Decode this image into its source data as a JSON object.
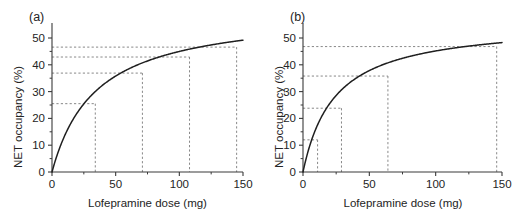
{
  "figure": {
    "background_color": "#ffffff",
    "curve_color": "#1f1f1f",
    "guide_color": "#7a7a7a",
    "axis_color": "#3a3a3a"
  },
  "panels": [
    {
      "id": "a",
      "label": "(a)",
      "axis_x_title": "Lofepramine dose (mg)",
      "axis_y_title": "NET occupancy (%)",
      "x_ticks": [
        "0",
        "50",
        "100",
        "150"
      ],
      "y_ticks": [
        "0",
        "10",
        "20",
        "30",
        "40",
        "50"
      ]
    },
    {
      "id": "b",
      "label": "(b)",
      "axis_x_title": "Lofepramine dose (mg)",
      "axis_y_title": "NET occupancy (%)",
      "x_ticks": [
        "0",
        "50",
        "100",
        "150"
      ],
      "y_ticks": [
        "0",
        "10",
        "20",
        "30",
        "40",
        "50"
      ]
    }
  ],
  "chart_data": [
    {
      "type": "line",
      "panel": "a",
      "title": "(a)",
      "xlabel": "Lofepramine dose (mg)",
      "ylabel": "NET occupancy (%)",
      "xlim": [
        0,
        150
      ],
      "ylim": [
        0,
        50
      ],
      "xticks": [
        0,
        50,
        100,
        150
      ],
      "yticks": [
        0,
        10,
        20,
        30,
        40,
        50
      ],
      "grid": false,
      "legend": "none",
      "model": "Emax saturating dose-occupancy curve",
      "emax": 60.5,
      "ed50": 34.5,
      "x": [
        0,
        5,
        10,
        15,
        20,
        25,
        30,
        34,
        40,
        50,
        60,
        70,
        80,
        90,
        100,
        110,
        120,
        130,
        140,
        150
      ],
      "y": [
        0,
        7.7,
        13.6,
        18.3,
        22.2,
        25.4,
        28.1,
        30.0,
        32.4,
        35.8,
        38.5,
        40.6,
        42.3,
        43.8,
        45.0,
        46.1,
        47.0,
        47.8,
        48.5,
        49.2
      ],
      "reference_lines": [
        {
          "dose": 34,
          "occupancy": 25.5
        },
        {
          "dose": 71,
          "occupancy": 36.9
        },
        {
          "dose": 108,
          "occupancy": 42.9
        },
        {
          "dose": 145,
          "occupancy": 46.6
        }
      ]
    },
    {
      "type": "line",
      "panel": "b",
      "title": "(b)",
      "xlabel": "Lofepramine dose (mg)",
      "ylabel": "NET occupancy (%)",
      "xlim": [
        0,
        150
      ],
      "ylim": [
        0,
        50
      ],
      "xticks": [
        0,
        50,
        100,
        150
      ],
      "yticks": [
        0,
        10,
        20,
        30,
        40,
        50
      ],
      "grid": false,
      "legend": "none",
      "model": "Emax saturating dose-occupancy curve",
      "emax": 56.0,
      "ed50": 24.0,
      "x": [
        0,
        5,
        10,
        12,
        20,
        25,
        29,
        35,
        45,
        55,
        64,
        75,
        85,
        95,
        105,
        115,
        125,
        135,
        146,
        150
      ],
      "y": [
        0,
        9.7,
        16.5,
        18.7,
        25.5,
        28.6,
        30.8,
        33.5,
        37.0,
        39.6,
        41.4,
        43.1,
        44.4,
        45.4,
        46.3,
        47.0,
        47.6,
        48.2,
        48.7,
        48.9
      ],
      "reference_lines": [
        {
          "dose": 11,
          "occupancy": 12.0
        },
        {
          "dose": 29,
          "occupancy": 23.8
        },
        {
          "dose": 64,
          "occupancy": 35.8
        },
        {
          "dose": 146,
          "occupancy": 46.8
        }
      ]
    }
  ]
}
